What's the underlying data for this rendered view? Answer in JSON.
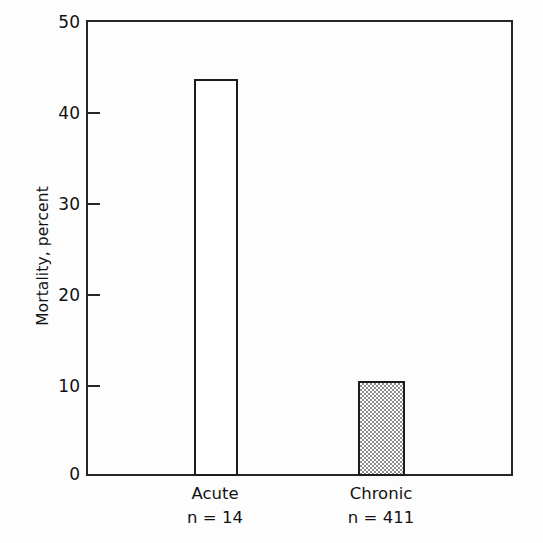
{
  "chart_data": {
    "type": "bar",
    "title": "",
    "subtitle": "",
    "xlabel": "",
    "ylabel": "Mortality, percent",
    "categories": [
      "Acute",
      "Chronic"
    ],
    "values": [
      43.5,
      10.4
    ],
    "annotations": [
      "n = 14",
      "n = 411"
    ],
    "series": [
      {
        "name": "Mortality",
        "values": [
          43.5,
          10.4
        ]
      }
    ],
    "points": [
      {
        "category": "Acute",
        "value": 43.5,
        "n_label": "n = 14",
        "fill": "open"
      },
      {
        "category": "Chronic",
        "value": 10.4,
        "n_label": "n = 411",
        "fill": "hatched"
      }
    ],
    "ylim": [
      0,
      50
    ],
    "yticks": [
      0,
      10,
      20,
      30,
      40,
      50
    ],
    "ytick_labels": [
      "0",
      "10",
      "20",
      "30",
      "40",
      "50"
    ],
    "grid": false,
    "legend": "none",
    "colors": {
      "axis": "#262626",
      "bar_outline": "#1c1c1c",
      "bar_open_fill": "#ffffff",
      "bar_hatched_fill": "#8d8d8d",
      "text": "#121212",
      "background": "#ffffff"
    }
  },
  "axis": {
    "y_title": "Mortality, percent",
    "ticks": [
      {
        "label": "50",
        "value": 50
      },
      {
        "label": "40",
        "value": 40
      },
      {
        "label": "30",
        "value": 30
      },
      {
        "label": "20",
        "value": 20
      },
      {
        "label": "10",
        "value": 10
      },
      {
        "label": "0",
        "value": 0
      }
    ]
  },
  "bars": [
    {
      "name": "Acute",
      "n_label": "n = 14",
      "value": 43.5
    },
    {
      "name": "Chronic",
      "n_label": "n = 411",
      "value": 10.4
    }
  ]
}
